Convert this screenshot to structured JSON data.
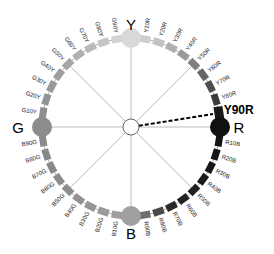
{
  "diagram": {
    "center": {
      "x": 131,
      "y": 127
    },
    "ring_radius": 89,
    "center_circle_radius": 8,
    "primaries": [
      {
        "name": "Y",
        "angle": -90,
        "color": "#d9d9d9"
      },
      {
        "name": "R",
        "angle": 0,
        "color": "#111111"
      },
      {
        "name": "B",
        "angle": 90,
        "color": "#a0a0a0"
      },
      {
        "name": "G",
        "angle": 180,
        "color": "#8c8c8c"
      }
    ],
    "highlight": {
      "label": "Y90R",
      "style": "dashed"
    },
    "swatches": [
      {
        "label": "Y10R",
        "color": "#cfcfcf"
      },
      {
        "label": "Y20R",
        "color": "#c2c2c2"
      },
      {
        "label": "Y30R",
        "color": "#b0b0b0"
      },
      {
        "label": "Y40R",
        "color": "#9a9a9a"
      },
      {
        "label": "Y50R",
        "color": "#7f7f7f"
      },
      {
        "label": "Y60R",
        "color": "#666666"
      },
      {
        "label": "Y70R",
        "color": "#4e4e4e"
      },
      {
        "label": "Y80R",
        "color": "#3a3a3a"
      },
      {
        "label": "Y90R",
        "color": "#1a1a1a"
      },
      {
        "label": "R10B",
        "color": "#141414"
      },
      {
        "label": "R20B",
        "color": "#161616"
      },
      {
        "label": "R30B",
        "color": "#181818"
      },
      {
        "label": "R40B",
        "color": "#1c1c1c"
      },
      {
        "label": "R50B",
        "color": "#1f1f1f"
      },
      {
        "label": "R60B",
        "color": "#232323"
      },
      {
        "label": "R70B",
        "color": "#2a2a2a"
      },
      {
        "label": "R80B",
        "color": "#4a4a4a"
      },
      {
        "label": "R90B",
        "color": "#6e6e6e"
      },
      {
        "label": "B10G",
        "color": "#9e9e9e"
      },
      {
        "label": "B20G",
        "color": "#9a9a9a"
      },
      {
        "label": "B30G",
        "color": "#969696"
      },
      {
        "label": "B40G",
        "color": "#929292"
      },
      {
        "label": "B50G",
        "color": "#8e8e8e"
      },
      {
        "label": "B60G",
        "color": "#8c8c8c"
      },
      {
        "label": "B70G",
        "color": "#8a8a8a"
      },
      {
        "label": "B80G",
        "color": "#888888"
      },
      {
        "label": "B90G",
        "color": "#8a8a8a"
      },
      {
        "label": "G10Y",
        "color": "#8e8e8e"
      },
      {
        "label": "G20Y",
        "color": "#939393"
      },
      {
        "label": "G30Y",
        "color": "#989898"
      },
      {
        "label": "G40Y",
        "color": "#9e9e9e"
      },
      {
        "label": "G50Y",
        "color": "#a6a6a6"
      },
      {
        "label": "G60Y",
        "color": "#b0b0b0"
      },
      {
        "label": "G70Y",
        "color": "#bababa"
      },
      {
        "label": "G80Y",
        "color": "#c6c6c6"
      },
      {
        "label": "G90Y",
        "color": "#d2d2d2"
      }
    ]
  }
}
